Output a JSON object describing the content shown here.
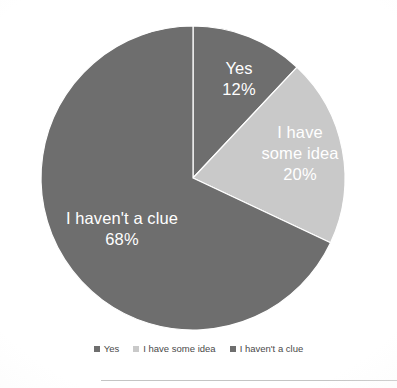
{
  "chart_data": {
    "type": "pie",
    "title": "",
    "subtitle": "",
    "xlabel": "",
    "ylabel": "",
    "grid": false,
    "legend_position": "bottom",
    "value_unit": "%",
    "center": {
      "x": 193,
      "y": 178
    },
    "radius": 152,
    "start_angle_deg": 0,
    "direction": "clockwise",
    "categories": [
      "Yes",
      "I have some idea",
      "I haven't a clue"
    ],
    "values": [
      12,
      20,
      68
    ],
    "colors": [
      "#6e6e6e",
      "#c9c9c9",
      "#6e6e6e"
    ],
    "slices": [
      {
        "label": "Yes",
        "value": 12,
        "value_text": "12%",
        "color": "#6e6e6e",
        "start_deg": 0,
        "end_deg": 43.2,
        "label_color": "#ffffff"
      },
      {
        "label": "I have some idea",
        "label_line1": "I have",
        "label_line2": "some idea",
        "value": 20,
        "value_text": "20%",
        "color": "#c9c9c9",
        "start_deg": 43.2,
        "end_deg": 115.2,
        "label_color": "#ffffff"
      },
      {
        "label": "I haven't a clue",
        "value": 68,
        "value_text": "68%",
        "color": "#6e6e6e",
        "start_deg": 115.2,
        "end_deg": 360,
        "label_color": "#ffffff"
      }
    ],
    "legend": [
      {
        "label": "Yes",
        "color": "#6e6e6e"
      },
      {
        "label": "I have some idea",
        "color": "#c9c9c9"
      },
      {
        "label": "I haven't a clue",
        "color": "#6e6e6e"
      }
    ]
  },
  "page": {
    "background_color": "#ffffff",
    "rule_color": "#c4c4c4"
  }
}
